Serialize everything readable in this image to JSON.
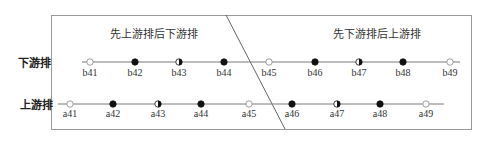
{
  "sections": {
    "left_title": "先上游排后下游排",
    "right_title": "先下游排后上游排"
  },
  "rows": [
    {
      "label": "下游排",
      "points": [
        {
          "name": "b41",
          "marker": "open"
        },
        {
          "name": "b42",
          "marker": "filled"
        },
        {
          "name": "b43",
          "marker": "half"
        },
        {
          "name": "b44",
          "marker": "filled"
        },
        {
          "name": "b45",
          "marker": "open"
        },
        {
          "name": "b46",
          "marker": "filled"
        },
        {
          "name": "b47",
          "marker": "half"
        },
        {
          "name": "b48",
          "marker": "filled"
        },
        {
          "name": "b49",
          "marker": "open"
        }
      ]
    },
    {
      "label": "上游排",
      "points": [
        {
          "name": "a41",
          "marker": "open"
        },
        {
          "name": "a42",
          "marker": "filled"
        },
        {
          "name": "a43",
          "marker": "half"
        },
        {
          "name": "a44",
          "marker": "filled"
        },
        {
          "name": "a45",
          "marker": "open"
        },
        {
          "name": "a46",
          "marker": "filled"
        },
        {
          "name": "a47",
          "marker": "half"
        },
        {
          "name": "a48",
          "marker": "filled"
        },
        {
          "name": "a49",
          "marker": "open"
        }
      ]
    }
  ],
  "colors": {
    "line": "#7a7a7a",
    "border": "#9a9a9a",
    "marker": "#111111"
  }
}
